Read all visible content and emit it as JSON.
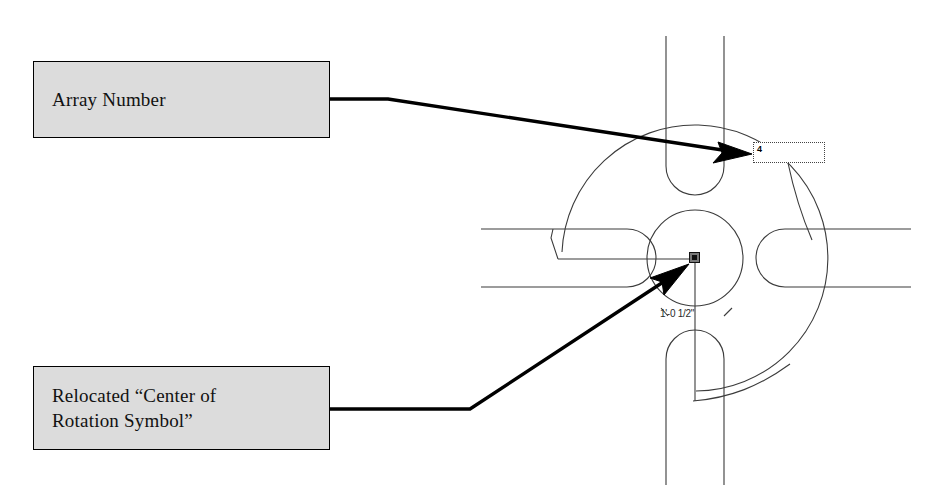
{
  "document": {
    "type": "cad-annotated-figure",
    "background_color": "#ffffff",
    "drawing_line_color": "#3b3b3b",
    "annotation_color": "#000000",
    "callout_fill_color": "#dcdcdc"
  },
  "callouts": [
    {
      "id": "array-number",
      "label": "Array Number",
      "box": {
        "x": 33,
        "y": 61,
        "width": 297,
        "height": 77
      },
      "leader": {
        "from_x": 330,
        "from_y": 99,
        "elbow_x": 388,
        "elbow_y": 99,
        "to_x": 751,
        "to_y": 153
      },
      "arrow": "right-arrowhead"
    },
    {
      "id": "relocated-center-of-rotation",
      "label": "Relocated “Center of\nRotation Symbol”",
      "box": {
        "x": 33,
        "y": 366,
        "width": 297,
        "height": 84
      },
      "leader": {
        "from_x": 330,
        "from_y": 409,
        "elbow_x": 470,
        "elbow_y": 409,
        "to_x": 688,
        "to_y": 264
      },
      "arrow": "up-right-arrowhead"
    }
  ],
  "drawing": {
    "center": {
      "x": 695,
      "y": 258
    },
    "inner_circle_radius": 48,
    "outer_arc_radius": 133,
    "arms": [
      {
        "name": "arm-top",
        "orientation": "vertical",
        "x": 666,
        "y": 36,
        "width": 58,
        "height": 159,
        "round_end": "bottom"
      },
      {
        "name": "arm-bottom",
        "orientation": "vertical",
        "x": 666,
        "y": 330,
        "width": 58,
        "height": 155,
        "round_end": "top"
      },
      {
        "name": "arm-left",
        "orientation": "horizontal",
        "x": 481,
        "y": 229,
        "width": 175,
        "height": 58,
        "round_end": "right"
      },
      {
        "name": "arm-right",
        "orientation": "horizontal",
        "x": 756,
        "y": 229,
        "width": 155,
        "height": 58,
        "round_end": "left"
      }
    ],
    "grips": [
      {
        "name": "grip-center-square",
        "x": 694,
        "y": 258,
        "shape": "square"
      },
      {
        "name": "grip-left-arm",
        "x": 558,
        "y": 259,
        "shape": "dot"
      },
      {
        "name": "grip-bottom-arm",
        "x": 693,
        "y": 401,
        "shape": "dot"
      }
    ],
    "array_number_textbox": {
      "name": "array-number-textbox",
      "value": "4",
      "x": 753,
      "y": 142,
      "width": 72,
      "height": 21
    },
    "dimension": {
      "name": "radius-dimension",
      "text": "1'-0 1/2\"",
      "x": 660,
      "y": 308
    }
  }
}
